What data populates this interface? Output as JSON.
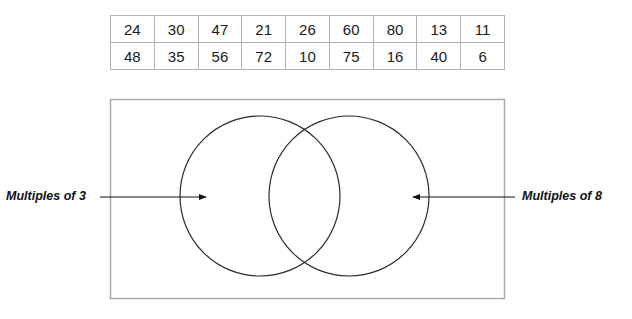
{
  "table": {
    "rows": [
      [
        "24",
        "30",
        "47",
        "21",
        "26",
        "60",
        "80",
        "13",
        "11"
      ],
      [
        "48",
        "35",
        "56",
        "72",
        "10",
        "75",
        "16",
        "40",
        "6"
      ]
    ]
  },
  "venn": {
    "sets": [
      {
        "label": "Multiples of 3",
        "position": "left"
      },
      {
        "label": "Multiples of 8",
        "position": "right"
      }
    ],
    "line_color": "#2a2a2a",
    "frame_color": "#aaaaaa"
  }
}
